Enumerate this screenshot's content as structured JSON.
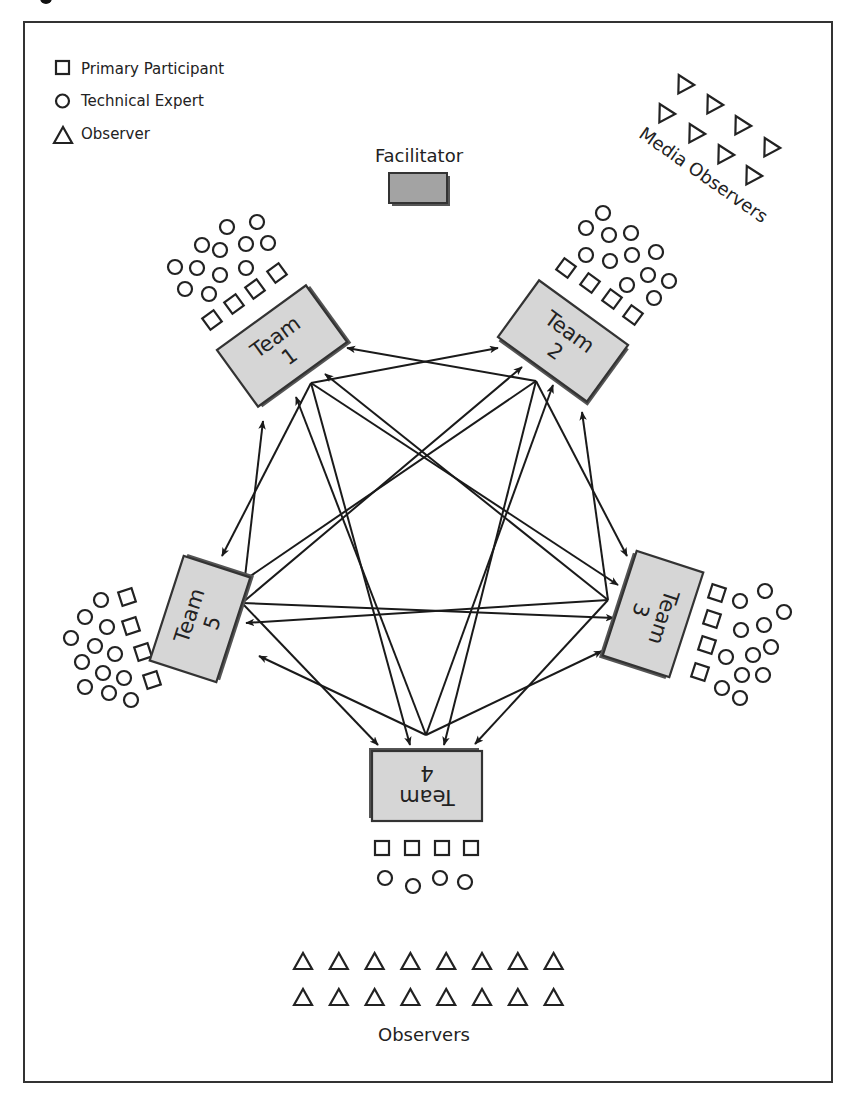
{
  "legend": [
    {
      "symbol": "square",
      "label": "Primary Participant"
    },
    {
      "symbol": "circle",
      "label": "Technical Expert"
    },
    {
      "symbol": "triangle",
      "label": "Observer"
    }
  ],
  "facilitator": {
    "label": "Facilitator"
  },
  "media_observers": {
    "label": "Media Observers",
    "count": 8
  },
  "observers": {
    "label": "Observers",
    "count": 16
  },
  "teams": [
    {
      "id": "team-1",
      "line1": "Team",
      "line2": "1",
      "primary_participants": 4,
      "technical_experts": 12
    },
    {
      "id": "team-2",
      "line1": "Team",
      "line2": "2",
      "primary_participants": 4,
      "technical_experts": 12
    },
    {
      "id": "team-3",
      "line1": "Team",
      "line2": "3",
      "primary_participants": 4,
      "technical_experts": 12
    },
    {
      "id": "team-4",
      "line1": "Team",
      "line2": "4",
      "primary_participants": 4,
      "technical_experts": 4
    },
    {
      "id": "team-5",
      "line1": "Team",
      "line2": "5",
      "primary_participants": 4,
      "technical_experts": 12
    }
  ],
  "connections": [
    {
      "from": "team-1",
      "to": "team-2"
    },
    {
      "from": "team-1",
      "to": "team-3"
    },
    {
      "from": "team-1",
      "to": "team-4"
    },
    {
      "from": "team-1",
      "to": "team-5"
    },
    {
      "from": "team-2",
      "to": "team-1"
    },
    {
      "from": "team-2",
      "to": "team-3"
    },
    {
      "from": "team-2",
      "to": "team-4"
    },
    {
      "from": "team-2",
      "to": "team-5"
    },
    {
      "from": "team-3",
      "to": "team-1"
    },
    {
      "from": "team-3",
      "to": "team-2"
    },
    {
      "from": "team-3",
      "to": "team-4"
    },
    {
      "from": "team-3",
      "to": "team-5"
    },
    {
      "from": "team-4",
      "to": "team-1"
    },
    {
      "from": "team-4",
      "to": "team-2"
    },
    {
      "from": "team-4",
      "to": "team-3"
    },
    {
      "from": "team-4",
      "to": "team-5"
    },
    {
      "from": "team-5",
      "to": "team-1"
    },
    {
      "from": "team-5",
      "to": "team-2"
    },
    {
      "from": "team-5",
      "to": "team-3"
    },
    {
      "from": "team-5",
      "to": "team-4"
    }
  ],
  "colors": {
    "team_fill": "#d6d6d6",
    "facilitator_fill": "#a3a3a3",
    "line": "#1a1a1a"
  }
}
